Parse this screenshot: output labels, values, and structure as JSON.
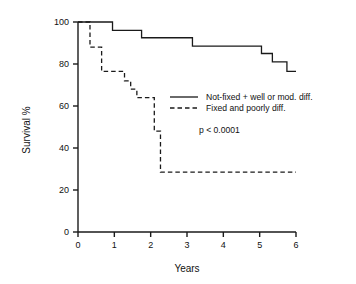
{
  "chart_data": {
    "type": "line",
    "subtype": "kaplan-meier-step",
    "title": "",
    "xlabel": "Years",
    "ylabel": "Survival %",
    "xlim": [
      0,
      6
    ],
    "ylim": [
      0,
      100
    ],
    "grid": false,
    "xticks": [
      0,
      1,
      2,
      3,
      4,
      5,
      6
    ],
    "xtick_labels": [
      "0",
      "1",
      "2",
      "3",
      "4",
      "5",
      "6"
    ],
    "yticks": [
      0,
      20,
      40,
      60,
      80,
      100
    ],
    "ytick_labels": [
      "0",
      "20",
      "40",
      "60",
      "80",
      "100"
    ],
    "legend_position": "center-right-inside",
    "annotations": [
      {
        "text": "p < 0.0001",
        "x": 3.0,
        "y": 44
      }
    ],
    "series": [
      {
        "name": "Not-fixed + well or mod. diff.",
        "style": "solid",
        "color": "#1a1a1a",
        "points": [
          {
            "x": 0.0,
            "y": 100.0
          },
          {
            "x": 0.95,
            "y": 100.0
          },
          {
            "x": 0.95,
            "y": 96.0
          },
          {
            "x": 1.75,
            "y": 96.0
          },
          {
            "x": 1.75,
            "y": 92.5
          },
          {
            "x": 3.15,
            "y": 92.5
          },
          {
            "x": 3.15,
            "y": 88.5
          },
          {
            "x": 5.05,
            "y": 88.5
          },
          {
            "x": 5.05,
            "y": 85.0
          },
          {
            "x": 5.35,
            "y": 85.0
          },
          {
            "x": 5.35,
            "y": 81.0
          },
          {
            "x": 5.75,
            "y": 81.0
          },
          {
            "x": 5.75,
            "y": 76.5
          },
          {
            "x": 6.0,
            "y": 76.5
          }
        ]
      },
      {
        "name": "Fixed and  poorly diff.",
        "style": "dashed",
        "color": "#1a1a1a",
        "points": [
          {
            "x": 0.0,
            "y": 100.0
          },
          {
            "x": 0.33,
            "y": 100.0
          },
          {
            "x": 0.33,
            "y": 88.0
          },
          {
            "x": 0.65,
            "y": 88.0
          },
          {
            "x": 0.65,
            "y": 76.5
          },
          {
            "x": 1.28,
            "y": 76.5
          },
          {
            "x": 1.28,
            "y": 72.0
          },
          {
            "x": 1.45,
            "y": 72.0
          },
          {
            "x": 1.45,
            "y": 68.0
          },
          {
            "x": 1.62,
            "y": 68.0
          },
          {
            "x": 1.62,
            "y": 64.0
          },
          {
            "x": 2.1,
            "y": 64.0
          },
          {
            "x": 2.1,
            "y": 48.0
          },
          {
            "x": 2.27,
            "y": 48.0
          },
          {
            "x": 2.27,
            "y": 28.5
          },
          {
            "x": 6.0,
            "y": 28.5
          }
        ]
      }
    ]
  },
  "legend": {
    "entries": [
      {
        "label": "Not-fixed + well or mod. diff.",
        "style": "solid"
      },
      {
        "label": "Fixed and  poorly diff.",
        "style": "dashed"
      }
    ]
  },
  "stats": {
    "p_value_text": "p < 0.0001"
  }
}
